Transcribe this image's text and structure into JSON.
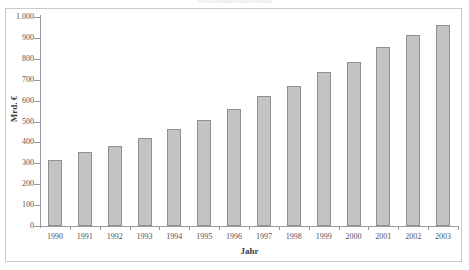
{
  "chart_data": {
    "type": "bar",
    "title": "Bruttoinlandsprodukt",
    "xlabel": "Jahr",
    "ylabel": "Mrd. €",
    "categories": [
      "1990",
      "1991",
      "1992",
      "1993",
      "1994",
      "1995",
      "1996",
      "1997",
      "1998",
      "1999",
      "2000",
      "2001",
      "2002",
      "2003"
    ],
    "values": [
      318,
      352,
      383,
      420,
      462,
      508,
      560,
      620,
      672,
      735,
      785,
      855,
      913,
      962
    ],
    "ylim": [
      0,
      1000
    ],
    "ytick_values": [
      0,
      100,
      200,
      300,
      400,
      500,
      600,
      700,
      800,
      900,
      1000
    ],
    "ytick_labels": [
      "0",
      "100",
      "200",
      "300",
      "400",
      "500",
      "600",
      "700",
      "800",
      "900",
      "1.000"
    ],
    "grid": false,
    "legend": null,
    "series": [
      {
        "name": "Mrd. €",
        "values": [
          318,
          352,
          383,
          420,
          462,
          508,
          560,
          620,
          672,
          735,
          785,
          855,
          913,
          962
        ]
      }
    ]
  },
  "style": {
    "bar_fill": "#c3c3c3",
    "bar_border": "#8f8f94",
    "axis_color": "#9a9aa2",
    "frame_color": "#c9c9cf",
    "text_color": "#52525a",
    "background": "#ffffff"
  }
}
